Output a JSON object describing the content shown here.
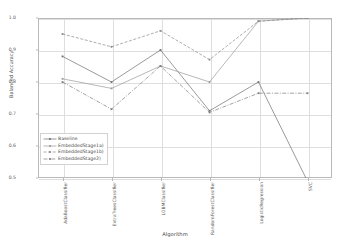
{
  "figure": {
    "xlabel": "Algorithm",
    "ylabel": "Balanced Accuracy"
  },
  "chart_data": {
    "type": "line",
    "title": "",
    "xlabel": "Algorithm",
    "ylabel": "Balanced Accuracy",
    "categories": [
      "AdaBoostClassifier",
      "ExtraTreesClassifier",
      "LGBMClassifier",
      "RandomForestClassifier",
      "LogisticRegression",
      "SVC"
    ],
    "ylim": [
      0.5,
      1.0
    ],
    "yticks": [
      "1.0",
      "0.9",
      "0.8",
      "0.7",
      "0.6",
      "0.5"
    ],
    "ytick_values": [
      1.0,
      0.9,
      0.8,
      0.7,
      0.6,
      0.5
    ],
    "grid": true,
    "legend_position": "lower left",
    "series": [
      {
        "name": "Baseline",
        "color": "#6f6f6f",
        "dash": "none",
        "marker": "square",
        "values": [
          0.88,
          0.8,
          0.9,
          0.71,
          0.8,
          0.49
        ]
      },
      {
        "name": "EmbeddedStage1a)",
        "color": "#9a9a9a",
        "dash": "none",
        "marker": "square",
        "values": [
          0.81,
          0.78,
          0.85,
          0.8,
          0.99,
          1.0
        ]
      },
      {
        "name": "EmbeddedStage1b)",
        "color": "#8a8a8a",
        "dash": "dashed",
        "marker": "square",
        "values": [
          0.95,
          0.91,
          0.96,
          0.87,
          0.99,
          1.0
        ]
      },
      {
        "name": "EmbeddedStage2)",
        "color": "#7d7d7d",
        "dash": "dashdot",
        "marker": "square",
        "values": [
          0.8,
          0.715,
          0.85,
          0.705,
          0.765,
          0.765
        ]
      }
    ]
  },
  "legend": {
    "items": [
      {
        "label": "Baseline"
      },
      {
        "label": "EmbeddedStage1a)"
      },
      {
        "label": "EmbeddedStage1b)"
      },
      {
        "label": "EmbeddedStage2)"
      }
    ]
  }
}
